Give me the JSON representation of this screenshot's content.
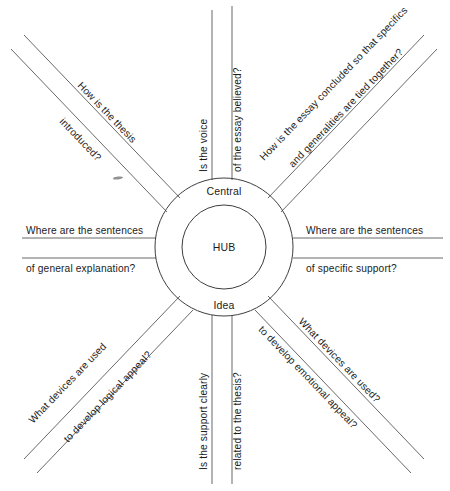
{
  "diagram": {
    "title": "HUB",
    "center_label_top": "Central",
    "center_label_bottom": "Idea",
    "stroke_color": "#58585a",
    "ring_color": "#3e3e40",
    "text_color": "#1c1c1c",
    "background_color": "#ffffff",
    "center_x": 224,
    "center_y": 247,
    "outer_radius": 69,
    "inner_radius": 42,
    "spoke_count": 8,
    "spokes": [
      {
        "id": "upper-left",
        "direction": "northwest",
        "line_a": "How is the thesis",
        "line_b": "introduced?"
      },
      {
        "id": "top",
        "direction": "north",
        "line_a": "Is the voice",
        "line_b": "of the essay believed?"
      },
      {
        "id": "upper-right",
        "direction": "northeast",
        "line_a": "How is the essay concluded so that specifics",
        "line_b": "and generalities are tied together?"
      },
      {
        "id": "right",
        "direction": "east",
        "line_a": "Where are the sentences",
        "line_b": "of specific support?"
      },
      {
        "id": "lower-right",
        "direction": "southeast",
        "line_a": "What devices are used?",
        "line_b": "to develop emotional appeal?"
      },
      {
        "id": "bottom",
        "direction": "south",
        "line_a": "Is the support clearly",
        "line_b": "related to the thesis?"
      },
      {
        "id": "lower-left",
        "direction": "southwest",
        "line_a": "What devices are used",
        "line_b": "to develop logical appeal?"
      },
      {
        "id": "left",
        "direction": "west",
        "line_a": "Where are the sentences",
        "line_b": "of general explanation?"
      }
    ]
  }
}
